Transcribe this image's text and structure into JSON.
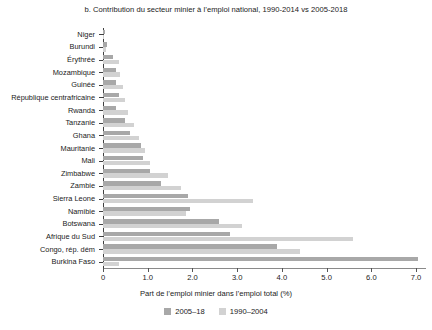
{
  "chart_data": {
    "type": "bar",
    "orientation": "horizontal",
    "title": "b. Contribution du secteur minier à l’emploi national, 1990-2014 vs 2005-2018",
    "xlabel": "Part de l’emploi minier dans l’emploi total (%)",
    "ylabel": "",
    "xlim": [
      0,
      7.2
    ],
    "xticks": [
      0,
      1.0,
      2.0,
      3.0,
      4.0,
      5.0,
      6.0,
      7.0
    ],
    "xticklabels": [
      "0",
      "1.0",
      "2.0",
      "3.0",
      "4.0",
      "5.0",
      "6.0",
      "7.0"
    ],
    "grid": false,
    "legend_position": "bottom",
    "categories": [
      "Niger",
      "Burundi",
      "Érythrée",
      "Mozambique",
      "Guinée",
      "République centrafricaine",
      "Rwanda",
      "Tanzanie",
      "Ghana",
      "Mauritanie",
      "Mali",
      "Zimbabwe",
      "Zambie",
      "Sierra Leone",
      "Namibie",
      "Botswana",
      "Afrique du Sud",
      "Congo, rép. dém",
      "Burkina Faso"
    ],
    "series": [
      {
        "name": "2005–18",
        "color": "#a8a8a8",
        "values": [
          0.04,
          0.1,
          0.22,
          0.28,
          0.3,
          0.35,
          0.3,
          0.5,
          0.6,
          0.85,
          0.9,
          1.05,
          1.3,
          1.9,
          1.95,
          2.6,
          2.85,
          3.9,
          7.05
        ]
      },
      {
        "name": "1990–2004",
        "color": "#d2d2d2",
        "values": [
          0.03,
          0.06,
          0.35,
          0.38,
          0.45,
          0.5,
          0.55,
          0.7,
          0.8,
          0.95,
          1.05,
          1.45,
          1.75,
          3.35,
          1.85,
          3.1,
          5.6,
          4.4,
          0.35
        ]
      }
    ],
    "legend": [
      {
        "label": "2005–18",
        "color": "#a8a8a8"
      },
      {
        "label": "1990–2004",
        "color": "#d2d2d2"
      }
    ]
  }
}
